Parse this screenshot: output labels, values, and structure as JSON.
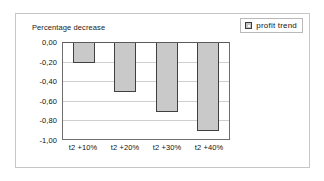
{
  "legend": {
    "marker_icon": "legend-square-icon",
    "label": "profit trend"
  },
  "chart_data": {
    "type": "bar",
    "title": "Percentage decrease",
    "xlabel": "",
    "ylabel": "",
    "categories": [
      "t2 +10%",
      "t2 +20%",
      "t2 +30%",
      "t2 +40%"
    ],
    "values": [
      -0.2,
      -0.5,
      -0.7,
      -0.9
    ],
    "series": [
      {
        "name": "profit trend",
        "values": [
          -0.2,
          -0.5,
          -0.7,
          -0.9
        ]
      }
    ],
    "ylim": [
      -1.0,
      0.0
    ],
    "yticks": [
      0.0,
      -0.2,
      -0.4,
      -0.6,
      -0.8,
      -1.0
    ],
    "ytick_labels": [
      "0,00",
      "-0,20",
      "-0,40",
      "-0,60",
      "-0,80",
      "-1,00"
    ],
    "grid": true,
    "legend_position": "top-right",
    "bar_color": "#c9c9c9",
    "bar_border_color": "#404040",
    "gridline_color": "#cfcfcf",
    "plot_background": "#ffffff"
  }
}
